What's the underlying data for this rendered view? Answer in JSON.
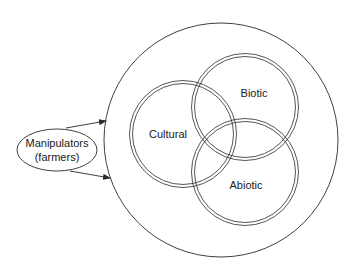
{
  "diagram": {
    "outer_circle": {
      "cx": 221,
      "cy": 140,
      "r": 117
    },
    "actor": {
      "line1": "Manipulators",
      "line2": "(farmers)",
      "cx": 57,
      "cy": 150,
      "rx": 40,
      "ry": 21
    },
    "circles": [
      {
        "label": "Cultural",
        "cx": 183,
        "cy": 134,
        "r": 52,
        "label_x": 168,
        "label_y": 138
      },
      {
        "label": "Biotic",
        "cx": 245,
        "cy": 107,
        "r": 52,
        "label_x": 254,
        "label_y": 97
      },
      {
        "label": "Abiotic",
        "cx": 245,
        "cy": 172,
        "r": 52,
        "label_x": 246,
        "label_y": 189
      }
    ],
    "arrows": [
      {
        "x1": 66,
        "y1": 128,
        "x2": 106,
        "y2": 121
      },
      {
        "x1": 70,
        "y1": 171,
        "x2": 110,
        "y2": 178
      }
    ],
    "colors": {
      "stroke": "#2a2a2a",
      "text": "#1a1a1a",
      "background": "#ffffff"
    }
  }
}
